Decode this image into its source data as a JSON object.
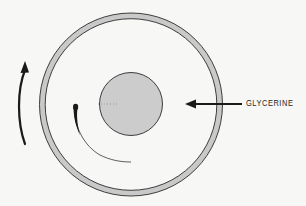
{
  "figure": {
    "type": "schematic",
    "colors": {
      "background": "#f7f7f5",
      "ring_fill": "#c9c9c9",
      "inner_cylinder_fill": "#cccccc",
      "outline": "#2a2a2a",
      "arrow": "#1a1a1a",
      "dye_streak": "#1a1a1a"
    },
    "outer_cylinder": {
      "center": [
        131,
        104.5
      ],
      "outer_radius": 92,
      "ring_thickness": 5.5
    },
    "inner_cylinder": {
      "center": [
        131,
        104
      ],
      "radius": 31.5
    },
    "rotation_arrow": {
      "direction": "counterclockwise",
      "meaning": "rotation of outer cylinder"
    },
    "dye_streak": {
      "meaning": "dye blob stretched into a thin spiral arc"
    }
  },
  "labels": {
    "glycerine": "GLYCERINE"
  }
}
